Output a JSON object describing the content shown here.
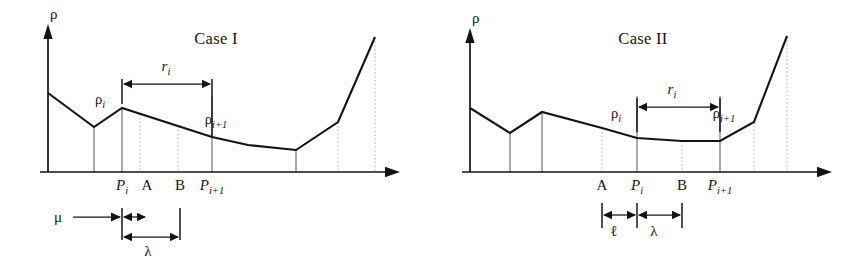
{
  "figure": {
    "panels": [
      {
        "id": "case-1",
        "title": "Case I",
        "axes": {
          "y_label": "ρ",
          "x_label": "",
          "origin_x": 48,
          "baseline_y": 172,
          "x_axis_end": 400,
          "y_axis_top": 28
        },
        "curve": {
          "comment": "piecewise linear density profile, pixel coords in panel space",
          "points": [
            [
              48,
              93
            ],
            [
              94,
              127
            ],
            [
              122,
              108
            ],
            [
              212,
              137
            ],
            [
              248,
              145
            ],
            [
              296,
              150
            ],
            [
              338,
              122
            ],
            [
              375,
              37
            ]
          ]
        },
        "gridlines": [
          {
            "x": 94,
            "style": "solid",
            "top": 127
          },
          {
            "x": 122,
            "style": "solid",
            "top": 108
          },
          {
            "x": 140,
            "style": "dotted",
            "top": 114
          },
          {
            "x": 178,
            "style": "dotted",
            "top": 126
          },
          {
            "x": 212,
            "style": "solid",
            "top": 96
          },
          {
            "x": 296,
            "style": "solid",
            "top": 150
          },
          {
            "x": 338,
            "style": "dotted",
            "top": 122
          },
          {
            "x": 375,
            "style": "dotted",
            "top": 37
          }
        ],
        "tick_labels": [
          {
            "text": "P",
            "sub": "i",
            "x": 122,
            "y": 190,
            "italic": true
          },
          {
            "text": "A",
            "sub": "",
            "x": 147,
            "y": 190,
            "italic": false
          },
          {
            "text": "B",
            "sub": "",
            "x": 180,
            "y": 190,
            "italic": false
          },
          {
            "text": "P",
            "sub": "i+1",
            "x": 212,
            "y": 190,
            "italic": true
          }
        ],
        "curve_labels": [
          {
            "text": "ρ",
            "sub": "i",
            "x": 100,
            "y": 104
          },
          {
            "text": "ρ",
            "sub": "i+1",
            "x": 216,
            "y": 124
          }
        ],
        "dimensions": [
          {
            "name": "r_i",
            "label": "r",
            "sub": "i",
            "label_x": 166,
            "label_y": 71,
            "type": "double-arrow",
            "y": 84,
            "x1": 122,
            "x2": 212,
            "end_ticks": [
              {
                "x": 122,
                "y1": 79,
                "y2": 104
              },
              {
                "x": 212,
                "y1": 79,
                "y2": 137
              }
            ]
          },
          {
            "name": "mu",
            "label": "μ",
            "sub": "",
            "label_x": 58,
            "label_y": 222,
            "type": "single-arrow-right",
            "y": 217,
            "x1": 73,
            "x2": 122
          },
          {
            "name": "mu_gap",
            "label": "",
            "sub": "",
            "type": "double-arrow-short",
            "y": 217,
            "x1": 122,
            "x2": 147
          },
          {
            "name": "lambda",
            "label": "λ",
            "sub": "",
            "label_x": 148,
            "label_y": 256,
            "type": "double-arrow",
            "y": 237,
            "x1": 122,
            "x2": 180,
            "end_ticks": [
              {
                "x": 122,
                "y1": 208,
                "y2": 240
              },
              {
                "x": 180,
                "y1": 208,
                "y2": 240
              }
            ]
          }
        ]
      },
      {
        "id": "case-2",
        "title": "Case II",
        "axes": {
          "y_label": "ρ",
          "x_label": "",
          "origin_x": 38,
          "baseline_y": 172,
          "x_axis_end": 400,
          "y_axis_top": 32
        },
        "curve": {
          "comment": "piecewise linear density profile, pixel coords in panel space",
          "points": [
            [
              38,
              108
            ],
            [
              78,
              133
            ],
            [
              110,
              112
            ],
            [
              170,
              128
            ],
            [
              205,
              138
            ],
            [
              250,
              141
            ],
            [
              288,
              141
            ],
            [
              322,
              122
            ],
            [
              355,
              36
            ]
          ]
        },
        "gridlines": [
          {
            "x": 78,
            "style": "solid",
            "top": 133
          },
          {
            "x": 110,
            "style": "solid",
            "top": 112
          },
          {
            "x": 170,
            "style": "dotted",
            "top": 128
          },
          {
            "x": 205,
            "style": "solid",
            "top": 96
          },
          {
            "x": 250,
            "style": "dotted",
            "top": 141
          },
          {
            "x": 288,
            "style": "solid",
            "top": 96
          },
          {
            "x": 322,
            "style": "dotted",
            "top": 122
          },
          {
            "x": 355,
            "style": "dotted",
            "top": 36
          }
        ],
        "tick_labels": [
          {
            "text": "A",
            "sub": "",
            "x": 170,
            "y": 190,
            "italic": false
          },
          {
            "text": "P",
            "sub": "i",
            "x": 205,
            "y": 190,
            "italic": true
          },
          {
            "text": "B",
            "sub": "",
            "x": 250,
            "y": 190,
            "italic": false
          },
          {
            "text": "P",
            "sub": "i+1",
            "x": 288,
            "y": 190,
            "italic": true
          }
        ],
        "curve_labels": [
          {
            "text": "ρ",
            "sub": "i",
            "x": 184,
            "y": 118
          },
          {
            "text": "ρ",
            "sub": "i+1",
            "x": 292,
            "y": 118
          }
        ],
        "dimensions": [
          {
            "name": "r_i",
            "label": "r",
            "sub": "i",
            "label_x": 240,
            "label_y": 94,
            "type": "double-arrow",
            "y": 107,
            "x1": 205,
            "x2": 288,
            "end_ticks": [
              {
                "x": 205,
                "y1": 98,
                "y2": 132
              },
              {
                "x": 288,
                "y1": 98,
                "y2": 132
              }
            ]
          },
          {
            "name": "ell",
            "label": "ℓ",
            "sub": "",
            "label_x": 182,
            "label_y": 236,
            "type": "double-arrow",
            "y": 215,
            "x1": 170,
            "x2": 205,
            "end_ticks": [
              {
                "x": 170,
                "y1": 203,
                "y2": 228
              },
              {
                "x": 205,
                "y1": 203,
                "y2": 228
              }
            ]
          },
          {
            "name": "lambda",
            "label": "λ",
            "sub": "",
            "label_x": 222,
            "label_y": 236,
            "type": "double-arrow",
            "y": 215,
            "x1": 205,
            "x2": 250,
            "end_ticks": [
              {
                "x": 250,
                "y1": 203,
                "y2": 228
              }
            ]
          }
        ]
      }
    ]
  },
  "chart_data": {
    "type": "line",
    "xlabel": "",
    "ylabel": "ρ",
    "grid": true,
    "legend": "none",
    "series": [
      {
        "name": "Case I ρ profile",
        "comment": "relative density values at successive breakpoints, higher = denser",
        "x": [
          0,
          46,
          74,
          164,
          200,
          248,
          290,
          327
        ],
        "values": [
          79,
          45,
          64,
          35,
          27,
          22,
          50,
          135
        ]
      },
      {
        "name": "Case II ρ profile",
        "comment": "relative density values at successive breakpoints, higher = denser",
        "x": [
          0,
          40,
          72,
          132,
          167,
          212,
          250,
          284,
          317
        ],
        "values": [
          64,
          39,
          60,
          44,
          34,
          31,
          31,
          50,
          136
        ]
      }
    ],
    "annotations": [
      {
        "panel": "Case I",
        "text": "ρᵢ",
        "meaning": "density at point P_i"
      },
      {
        "panel": "Case I",
        "text": "ρᵢ₊₁",
        "meaning": "density at point P_{i+1}"
      },
      {
        "panel": "Case I",
        "text": "rᵢ",
        "meaning": "distance from P_i to P_{i+1}"
      },
      {
        "panel": "Case I",
        "text": "μ",
        "meaning": "offset measured up to P_i"
      },
      {
        "panel": "Case I",
        "text": "λ",
        "meaning": "interval from P_i to B"
      },
      {
        "panel": "Case I",
        "text": "A",
        "meaning": "left sample boundary, located after P_i"
      },
      {
        "panel": "Case I",
        "text": "B",
        "meaning": "right sample boundary, before P_{i+1}"
      },
      {
        "panel": "Case II",
        "text": "ℓ",
        "meaning": "interval from A to P_i"
      },
      {
        "panel": "Case II",
        "text": "λ",
        "meaning": "interval from P_i to B"
      },
      {
        "panel": "Case II",
        "text": "A",
        "meaning": "left sample boundary, located before P_i"
      },
      {
        "panel": "Case II",
        "text": "B",
        "meaning": "right sample boundary, before P_{i+1}"
      }
    ]
  }
}
